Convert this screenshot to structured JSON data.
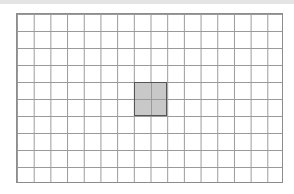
{
  "grid": {
    "columns": 16,
    "rows": 10,
    "line_color": "#9a9a9a",
    "background": "#ffffff"
  },
  "selection": {
    "start_column": 8,
    "start_row": 4,
    "span_columns": 2,
    "span_rows": 2,
    "fill_color": "#c8c8c8",
    "border_color": "#555555"
  }
}
